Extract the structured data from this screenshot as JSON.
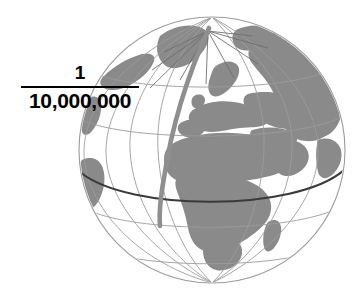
{
  "figure": {
    "type": "globe-scale-illustration",
    "background_color": "#ffffff"
  },
  "scale": {
    "numerator": "1",
    "denominator": "10,000,000",
    "ratio_text": "1/10,000,000",
    "bar_color": "#000000",
    "text_color": "#000000"
  },
  "globe": {
    "name": "earth-globe",
    "projection": "orthographic",
    "center_longitude_deg": 20,
    "center_latitude_deg": 0,
    "center_x": 212,
    "center_y": 150,
    "radius": 133,
    "land_color": "#8a8a8a",
    "ocean_color": "#ffffff",
    "graticule_color": "#9a9a9a",
    "outline_color": "#9a9a9a",
    "equator_color": "#3a3a3a",
    "prime_meridian_color": "#8f8f8f",
    "features": [
      "north-pole",
      "europe",
      "africa",
      "greenland",
      "scandinavia",
      "mediterranean-sea",
      "arabian-peninsula",
      "madagascar",
      "south-america-limb",
      "asia-limb"
    ],
    "graticule": {
      "meridian_spacing_deg": 30,
      "parallel_spacing_deg": 30
    }
  }
}
